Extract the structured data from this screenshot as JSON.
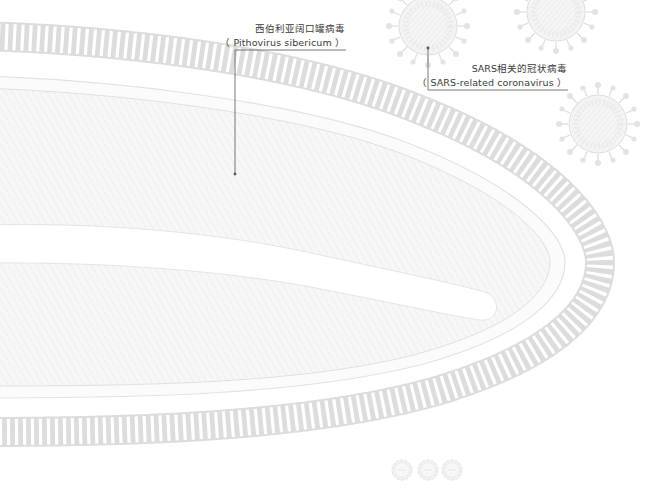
{
  "labels": {
    "pithovirus": {
      "chinese": "西伯利亚阔口罐病毒",
      "scientific": "（ Pithovirus sibericum ）"
    },
    "sars": {
      "chinese": "SARS相关的冠状病毒",
      "scientific": "（ SARS-related coronavirus ）"
    }
  },
  "colors": {
    "stroke": "#d4d4d4",
    "fill": "#f4f4f4",
    "leader": "#555555",
    "text": "#3a3a3a"
  }
}
